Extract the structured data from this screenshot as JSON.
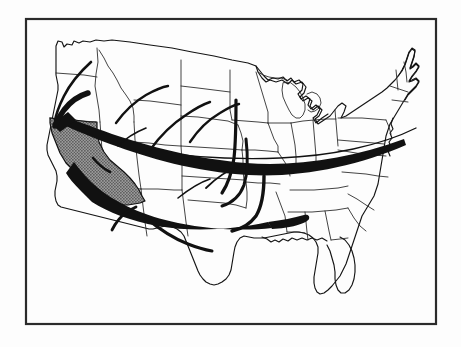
{
  "figure": {
    "title": "Migration flows into California",
    "width": 461,
    "height": 347
  },
  "colors": {
    "page_background": "#fdfdfd",
    "frame_stroke": "#2b2b2b",
    "map_fill": "#ffffff",
    "map_outline": "#141414",
    "state_border": "#222222",
    "highlight_fill": "#878787",
    "highlight_pattern_dot": "#4a4a4a",
    "arrow_fill": "#111111"
  },
  "frame": {
    "name": "image-border",
    "x": 25,
    "y": 18,
    "width": 412,
    "height": 307,
    "stroke_width": 2.2
  },
  "highlight": {
    "state_name": "California",
    "fill_style": "gray-halftone",
    "is_destination": true
  },
  "flows": [
    {
      "id": "flow-northwest-thin",
      "label": "Pacific Northwest inland tail",
      "style": "thin-tail",
      "origin_region": "Washington / Idaho panhandle",
      "destination": "Northern California",
      "stroke_width": 2.6
    },
    {
      "id": "flow-northwest-thick",
      "label": "Pacific Northwest flow",
      "style": "tapered-tail",
      "origin_region": "Oregon / Washington",
      "destination": "Northern California",
      "stroke_width": 5.5
    },
    {
      "id": "flow-main-upper",
      "label": "Primary northern transcontinental flow",
      "style": "tapered-trunk",
      "origin_region": "Northeast / Great Lakes",
      "destination": "Northern California",
      "max_width": 9
    },
    {
      "id": "flow-main-lower",
      "label": "Primary southern transcontinental flow",
      "style": "tapered-trunk",
      "origin_region": "Southeast / Gulf States",
      "destination": "Southern California",
      "max_width": 15
    },
    {
      "id": "flow-plains-a",
      "label": "Northern Plains feeder",
      "style": "thin-tail",
      "origin_region": "Dakotas / Nebraska",
      "destination": "Main northern trunk",
      "stroke_width": 2.4
    },
    {
      "id": "flow-plains-b",
      "label": "Central Plains feeder",
      "style": "thin-tail",
      "origin_region": "Kansas / Missouri",
      "destination": "Main northern trunk",
      "stroke_width": 2.4
    },
    {
      "id": "flow-midsouth",
      "label": "Mid-South feeder",
      "style": "thin-tail",
      "origin_region": "Arkansas / Tennessee",
      "destination": "Main southern trunk",
      "stroke_width": 3.2
    },
    {
      "id": "flow-gulf",
      "label": "Gulf Coast feeder",
      "style": "thin-tail",
      "origin_region": "Louisiana / Mississippi",
      "destination": "Main southern trunk",
      "stroke_width": 3.4
    },
    {
      "id": "flow-texas",
      "label": "Texas feeder",
      "style": "thin-tail",
      "origin_region": "Texas",
      "destination": "Main southern trunk",
      "stroke_width": 3.0
    },
    {
      "id": "flow-southwest",
      "label": "Desert Southwest feeder",
      "style": "thin-tail",
      "origin_region": "Arizona / New Mexico",
      "destination": "Southern California",
      "stroke_width": 2.8
    },
    {
      "id": "flow-mountain",
      "label": "Mountain West feeder",
      "style": "thin-tail",
      "origin_region": "Colorado / Utah",
      "destination": "Main northern trunk",
      "stroke_width": 2.4
    },
    {
      "id": "flow-northeast-long",
      "label": "Long Northeast corridor tail",
      "style": "hairline-tail",
      "origin_region": "New England / Mid-Atlantic",
      "destination": "Main northern trunk",
      "stroke_width": 1.3
    }
  ]
}
